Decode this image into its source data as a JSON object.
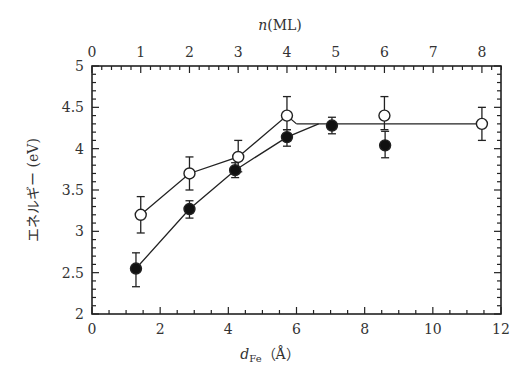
{
  "chart_data": {
    "type": "scatter",
    "title": "",
    "xlabel": "d_Fe (Å)",
    "xlabel_main": "d",
    "xlabel_sub": "Fe",
    "xlabel_unit": "（Å）",
    "ylabel": "エネルギー (eV)",
    "top_xlabel": "n (ML)",
    "top_xlabel_var": "n",
    "top_xlabel_unit": "(ML)",
    "xlim": [
      0,
      12
    ],
    "ylim": [
      2,
      5
    ],
    "top_xlim_ml": [
      0,
      8.4
    ],
    "angstrom_per_ml": 1.43,
    "x_ticks": [
      "0",
      "2",
      "4",
      "6",
      "8",
      "10",
      "12"
    ],
    "x_tick_values": [
      0,
      2,
      4,
      6,
      8,
      10,
      12
    ],
    "x_minor_step": 0.5,
    "y_ticks": [
      "2",
      "2.5",
      "3",
      "3.5",
      "4",
      "4.5",
      "5"
    ],
    "y_tick_values": [
      2,
      2.5,
      3,
      3.5,
      4,
      4.5,
      5
    ],
    "y_minor_step": 0.1,
    "top_ticks": [
      "0",
      "1",
      "2",
      "3",
      "4",
      "5",
      "6",
      "7",
      "8"
    ],
    "top_tick_values": [
      0,
      1,
      2,
      3,
      4,
      5,
      6,
      7,
      8
    ],
    "top_minor_step": 0.2,
    "grid": false,
    "legend": "none",
    "series": [
      {
        "name": "open circles",
        "marker": "open-circle",
        "x": [
          1.43,
          2.86,
          4.29,
          5.72,
          8.58,
          11.44
        ],
        "y": [
          3.2,
          3.7,
          3.9,
          4.4,
          4.4,
          4.3
        ],
        "err_low": [
          2.98,
          3.5,
          3.72,
          4.23,
          4.23,
          4.1
        ],
        "err_high": [
          3.42,
          3.9,
          4.1,
          4.63,
          4.63,
          4.5
        ],
        "guide_line": {
          "x": [
            1.43,
            2.86,
            4.29,
            5.72,
            6.0
          ],
          "y": [
            3.2,
            3.7,
            3.9,
            4.4,
            4.3
          ]
        }
      },
      {
        "name": "filled circles",
        "marker": "filled-circle",
        "x": [
          1.29,
          2.86,
          4.2,
          5.72,
          7.04,
          8.6
        ],
        "y": [
          2.55,
          3.27,
          3.74,
          4.14,
          4.28,
          4.04
        ],
        "err_low": [
          2.33,
          3.16,
          3.65,
          4.03,
          4.18,
          3.89
        ],
        "err_high": [
          2.74,
          3.37,
          3.83,
          4.23,
          4.38,
          4.21
        ],
        "guide_line": {
          "x": [
            1.29,
            2.86,
            4.2,
            5.72,
            6.65
          ],
          "y": [
            2.55,
            3.27,
            3.74,
            4.14,
            4.3
          ]
        }
      }
    ],
    "plateau_line": {
      "x": [
        6.0,
        11.3
      ],
      "y": [
        4.3,
        4.3
      ]
    }
  }
}
